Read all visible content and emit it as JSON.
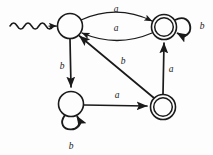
{
  "diagram": {
    "type": "state-transition-diagram",
    "background_color": "#fdfdfd",
    "stroke_color": "#1a1a1a",
    "alphabet": [
      "a",
      "b"
    ],
    "states": [
      {
        "id": "q0",
        "role": "start",
        "accepting": false,
        "label": "",
        "cx": 70,
        "cy": 26,
        "r": 12.5
      },
      {
        "id": "q1",
        "role": "normal",
        "accepting": true,
        "label": "",
        "cx": 164,
        "cy": 27,
        "r": 12.5
      },
      {
        "id": "q2",
        "role": "normal",
        "accepting": false,
        "label": "",
        "cx": 71,
        "cy": 104,
        "r": 12.5
      },
      {
        "id": "q3",
        "role": "normal",
        "accepting": true,
        "label": "",
        "cx": 163,
        "cy": 107,
        "r": 12.5
      }
    ],
    "start_marker": {
      "kind": "wavy-arrow",
      "from_x": 10,
      "to_x": 57,
      "y": 26,
      "target": "q0"
    },
    "transitions": [
      {
        "id": "t1",
        "from": "q0",
        "to": "q1",
        "symbol": "a",
        "shape": "curve-upper",
        "label_x": 116,
        "label_y": 10
      },
      {
        "id": "t2",
        "from": "q1",
        "to": "q0",
        "symbol": "a",
        "shape": "curve-lower",
        "label_x": 116,
        "label_y": 29
      },
      {
        "id": "t3",
        "from": "q1",
        "to": "q1",
        "symbol": "b",
        "shape": "self-loop-right",
        "label_x": 202,
        "label_y": 27
      },
      {
        "id": "t4",
        "from": "q0",
        "to": "q2",
        "symbol": "b",
        "shape": "line-vertical-left",
        "label_x": 62,
        "label_y": 67
      },
      {
        "id": "t5",
        "from": "q3",
        "to": "q0",
        "symbol": "b",
        "shape": "line-diagonal",
        "label_x": 123,
        "label_y": 62
      },
      {
        "id": "t6",
        "from": "q3",
        "to": "q1",
        "symbol": "a",
        "shape": "line-vertical-right",
        "label_x": 171,
        "label_y": 70
      },
      {
        "id": "t7",
        "from": "q2",
        "to": "q3",
        "symbol": "a",
        "shape": "line-horizontal-bottom",
        "label_x": 117,
        "label_y": 96
      },
      {
        "id": "t8",
        "from": "q2",
        "to": "q2",
        "symbol": "b",
        "shape": "self-loop-bottom",
        "label_x": 71,
        "label_y": 147
      }
    ]
  }
}
